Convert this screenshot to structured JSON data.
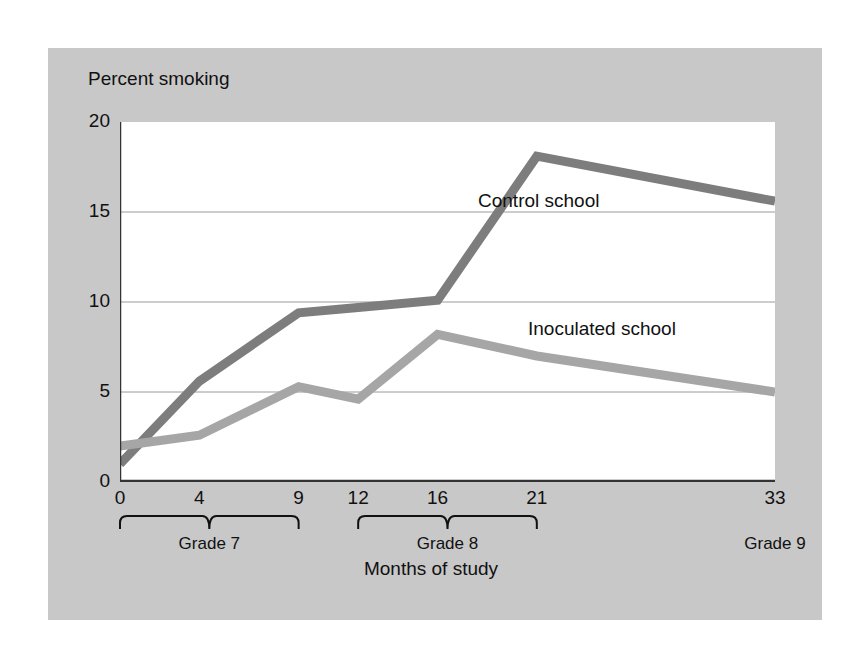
{
  "chart_data": {
    "type": "line",
    "title": "",
    "xlabel": "Months of study",
    "ylabel": "Percent smoking",
    "x": [
      0,
      4,
      9,
      12,
      16,
      21,
      33
    ],
    "xtick_labels": [
      "0",
      "4",
      "9",
      "12",
      "16",
      "21",
      "33"
    ],
    "ytick_labels": [
      "0",
      "5",
      "10",
      "15",
      "20"
    ],
    "yticks": [
      0,
      5,
      10,
      15,
      20
    ],
    "ylim": [
      0,
      20
    ],
    "xlim": [
      0,
      33
    ],
    "grid": "horizontal",
    "legend_position": "inline-annotation",
    "series": [
      {
        "name": "Control school",
        "color": "#7d7d7d",
        "values": [
          1.0,
          5.6,
          9.4,
          9.7,
          10.1,
          18.1,
          15.6
        ]
      },
      {
        "name": "Inoculated school",
        "color": "#a6a6a6",
        "values": [
          2.0,
          2.6,
          5.3,
          4.6,
          8.2,
          7.0,
          5.0
        ]
      }
    ],
    "group_brackets": [
      {
        "label": "Grade 7",
        "from": 0,
        "to": 9
      },
      {
        "label": "Grade 8",
        "from": 12,
        "to": 21
      },
      {
        "label": "Grade 9",
        "from": 33,
        "to": 33
      }
    ]
  },
  "figure": {
    "background": "#ffffff",
    "panel_color": "#c8c8c8",
    "plot_background": "#ffffff",
    "gridline_color": "#9a9a9a",
    "axis_color": "#333333"
  }
}
